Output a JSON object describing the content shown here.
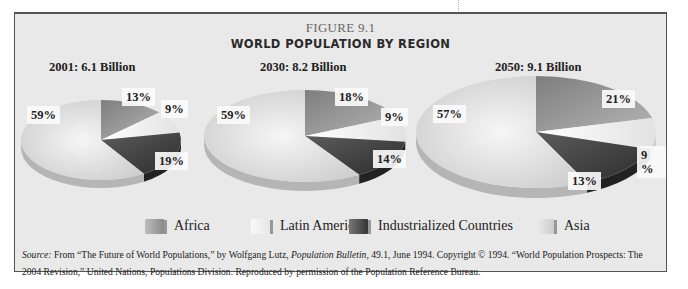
{
  "figure": {
    "number": "FIGURE 9.1",
    "title": "WORLD POPULATION BY REGION"
  },
  "colors": {
    "Africa": "#9a9a9a",
    "Latin America": "#f4f4f4",
    "Industrialized Countries": "#4a4a4a",
    "Asia": "#dcdcdc",
    "frame_bg": "#e9e9e9",
    "frame_border": "#555555"
  },
  "legend": {
    "items": [
      {
        "label": "Africa",
        "swatch": "medium-gray"
      },
      {
        "label": "Latin America",
        "swatch": "very-light-gray"
      },
      {
        "label": "Industrialized Countries",
        "swatch": "dark-gray"
      },
      {
        "label": "Asia",
        "swatch": "light-gray"
      }
    ]
  },
  "pies": [
    {
      "label": "2001: 6.1 Billion",
      "percent_labels": {
        "Asia": "59%",
        "Africa": "13%",
        "Latin America": "9%",
        "Industrialized Countries": "19%"
      }
    },
    {
      "label": "2030: 8.2 Billion",
      "percent_labels": {
        "Asia": "59%",
        "Africa": "18%",
        "Latin America": "9%",
        "Industrialized Countries": "14%"
      }
    },
    {
      "label": "2050: 9.1 Billion",
      "percent_labels": {
        "Asia": "57%",
        "Africa": "21%",
        "Latin America": "9 %",
        "Industrialized Countries": "13%"
      }
    }
  ],
  "source": {
    "prefix": "Source:",
    "part1": " From “The Future of World Populations,” by Wolfgang Lutz, ",
    "publication": "Population Bulletin",
    "part2": ", 49.1, June 1994. Copyright © 1994. “World Population Prospects: The 2004 Revision,” United Nations, Populations Division. Reproduced by permission of the Population Reference Bureau."
  },
  "chart_data": [
    {
      "type": "pie",
      "title": "2001: 6.1 Billion",
      "categories": [
        "Africa",
        "Latin America",
        "Industrialized Countries",
        "Asia"
      ],
      "values": [
        13,
        9,
        19,
        59
      ]
    },
    {
      "type": "pie",
      "title": "2030: 8.2 Billion",
      "categories": [
        "Africa",
        "Latin America",
        "Industrialized Countries",
        "Asia"
      ],
      "values": [
        18,
        9,
        14,
        59
      ]
    },
    {
      "type": "pie",
      "title": "2050: 9.1 Billion",
      "categories": [
        "Africa",
        "Latin America",
        "Industrialized Countries",
        "Asia"
      ],
      "values": [
        21,
        9,
        13,
        57
      ]
    }
  ]
}
